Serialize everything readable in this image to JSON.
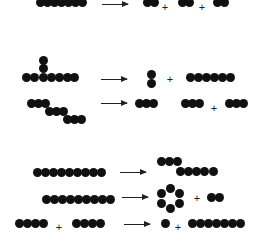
{
  "figure": {
    "dot_color": "#111111",
    "background": "#ffffff",
    "plus_symbol": "+",
    "arrow_symbol": "→"
  },
  "reactions": [
    {
      "id": "r1",
      "reactants": [
        {
          "shape": "linear",
          "count": 6
        }
      ],
      "products": [
        {
          "shape": "linear",
          "count": 2
        },
        {
          "shape": "linear",
          "count": 2
        },
        {
          "shape": "linear",
          "count": 2
        }
      ],
      "dots": [
        [
          36,
          -2
        ],
        [
          43,
          -2
        ],
        [
          50,
          -2
        ],
        [
          57,
          -2
        ],
        [
          64,
          -2
        ],
        [
          71,
          -2
        ],
        [
          78,
          -2
        ],
        [
          143,
          -2
        ],
        [
          150,
          -2
        ],
        [
          178,
          -2
        ],
        [
          185,
          -2
        ],
        [
          213,
          -2
        ],
        [
          220,
          -2
        ]
      ],
      "plus": [
        [
          160,
          2
        ],
        [
          197,
          2
        ]
      ],
      "arrow": {
        "x": 102,
        "y": 4,
        "w": 26
      }
    },
    {
      "id": "r2",
      "reactants": [
        {
          "shape": "T-branched",
          "count": 9
        }
      ],
      "products": [
        {
          "shape": "linear-vertical",
          "count": 2
        },
        {
          "shape": "linear",
          "count": 6
        }
      ],
      "dots": [
        [
          39,
          56
        ],
        [
          39,
          64
        ],
        [
          22,
          73
        ],
        [
          30,
          73
        ],
        [
          39,
          73
        ],
        [
          47,
          73
        ],
        [
          55,
          73
        ],
        [
          63,
          73
        ],
        [
          70,
          73
        ],
        [
          147,
          70
        ],
        [
          147,
          79
        ],
        [
          186,
          73
        ],
        [
          194,
          73
        ],
        [
          202,
          73
        ],
        [
          210,
          73
        ],
        [
          218,
          73
        ],
        [
          226,
          73
        ]
      ],
      "plus": [
        [
          165,
          74
        ]
      ],
      "arrow": {
        "x": 101,
        "y": 79,
        "w": 26
      }
    },
    {
      "id": "r3",
      "reactants": [
        {
          "shape": "zigzag",
          "count": 9
        }
      ],
      "products": [
        {
          "shape": "linear",
          "count": 3
        },
        {
          "shape": "linear",
          "count": 3
        },
        {
          "shape": "linear",
          "count": 3
        }
      ],
      "dots": [
        [
          27,
          99
        ],
        [
          34,
          99
        ],
        [
          41,
          99
        ],
        [
          45,
          107
        ],
        [
          52,
          107
        ],
        [
          59,
          107
        ],
        [
          63,
          115
        ],
        [
          70,
          115
        ],
        [
          77,
          115
        ],
        [
          135,
          99
        ],
        [
          142,
          99
        ],
        [
          149,
          99
        ],
        [
          181,
          99
        ],
        [
          188,
          99
        ],
        [
          195,
          99
        ],
        [
          225,
          99
        ],
        [
          232,
          99
        ],
        [
          239,
          99
        ]
      ],
      "plus": [
        [
          209,
          103
        ]
      ],
      "arrow": {
        "x": 101,
        "y": 103,
        "w": 26
      }
    },
    {
      "id": "r4",
      "reactants": [
        {
          "shape": "linear",
          "count": 9
        }
      ],
      "products": [
        {
          "shape": "branched-offset",
          "count": 8
        }
      ],
      "dots": [
        [
          33,
          168
        ],
        [
          41,
          168
        ],
        [
          49,
          168
        ],
        [
          57,
          168
        ],
        [
          65,
          168
        ],
        [
          73,
          168
        ],
        [
          81,
          168
        ],
        [
          89,
          168
        ],
        [
          97,
          168
        ],
        [
          157,
          157
        ],
        [
          165,
          157
        ],
        [
          173,
          157
        ],
        [
          176,
          167
        ],
        [
          184,
          167
        ],
        [
          192,
          167
        ],
        [
          200,
          167
        ],
        [
          209,
          167
        ]
      ],
      "plus": [],
      "arrow": {
        "x": 120,
        "y": 172,
        "w": 26
      }
    },
    {
      "id": "r5",
      "reactants": [
        {
          "shape": "linear",
          "count": 9
        }
      ],
      "products": [
        {
          "shape": "ring",
          "count": 6
        },
        {
          "shape": "linear",
          "count": 2
        }
      ],
      "dots": [
        [
          42,
          195
        ],
        [
          50,
          195
        ],
        [
          58,
          195
        ],
        [
          66,
          195
        ],
        [
          74,
          195
        ],
        [
          82,
          195
        ],
        [
          90,
          195
        ],
        [
          98,
          195
        ],
        [
          106,
          195
        ],
        [
          166,
          184
        ],
        [
          175,
          189
        ],
        [
          175,
          199
        ],
        [
          166,
          204
        ],
        [
          157,
          199
        ],
        [
          157,
          189
        ],
        [
          207,
          193
        ],
        [
          215,
          193
        ]
      ],
      "plus": [
        [
          192,
          193
        ]
      ],
      "arrow": {
        "x": 122,
        "y": 197,
        "w": 26
      }
    },
    {
      "id": "r6",
      "reactants": [
        {
          "shape": "linear",
          "count": 4
        },
        {
          "shape": "linear",
          "count": 4
        }
      ],
      "products": [
        {
          "shape": "single",
          "count": 1
        },
        {
          "shape": "linear",
          "count": 7
        }
      ],
      "dots": [
        [
          15,
          219
        ],
        [
          23,
          219
        ],
        [
          31,
          219
        ],
        [
          39,
          219
        ],
        [
          72,
          219
        ],
        [
          80,
          219
        ],
        [
          88,
          219
        ],
        [
          96,
          219
        ],
        [
          161,
          219
        ],
        [
          188,
          219
        ],
        [
          196,
          219
        ],
        [
          204,
          219
        ],
        [
          212,
          219
        ],
        [
          220,
          219
        ],
        [
          228,
          219
        ],
        [
          236,
          219
        ]
      ],
      "plus": [
        [
          54,
          222
        ],
        [
          173,
          222
        ]
      ],
      "arrow": {
        "x": 124,
        "y": 224,
        "w": 26
      }
    }
  ]
}
